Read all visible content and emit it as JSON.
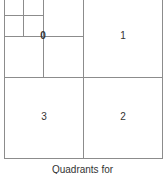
{
  "diagram": {
    "labels": {
      "q0": "0",
      "q1": "1",
      "q2": "2",
      "q3": "3"
    },
    "caption": "Quadrants for",
    "line_color": "#8c8c8c"
  }
}
